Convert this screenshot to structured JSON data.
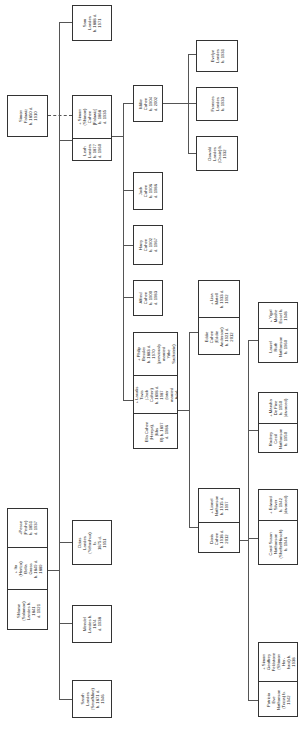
{
  "diagram": {
    "type": "family-tree",
    "orientation": "rotated-90-ccw",
    "root_couple": {
      "spouse": "Simon Falowiz\nb. 1850 d. 1910",
      "person": "Leah Landes\nb. 1877\nd. 1960",
      "husband": "+ Simon\n(Shimon) Cohen\n[Falowiz] b. 1868\nd. 1935"
    },
    "generation1": {
      "sam": "Sam Landes\nb. 1888 d. 1971",
      "ozias": "Ozias Landes\n(Yehoshua) b.\n1875 d. 1951",
      "mendel": "Mendel\nLandes b. 1874\nd. 1938",
      "sarah": "Sarah Landes\n(Sera/Mine)\nb. 1871 d. 1946",
      "parents": {
        "shlome": "Shlome (Solomon)\nLandes b. 1841\nd. 1921",
        "ita": "+ Ita (Hertzo)\nBella Gross\nb. 1849 d. 1889",
        "peshe": "+Pesse\n(Peshe)\nb. 1851\nd. 1937"
      }
    },
    "generation2": {
      "millie": "Millie Cohen\nb. 1904 d. 2002",
      "jack": "Jack Cohen\nb. 1906 d. 1986",
      "harry": "Harry Cohen\nb. 1902 d. 1967",
      "alfred": "Alfred Cohen\nb. 1900 d. 1983",
      "ella": "Ella Cohen\n(Henya), (Mrs\nB) b. 1897\nd. 1986",
      "lavalis": "+ Lavalis Tsvis\n(Jack Cohen)\nb. 1898 d. 1987\n(later married\nAda)",
      "philip": "+ Philip Bessler\nb. 1883 d. 1970\n(previously\nmarried Yitke\nSackstein)"
    },
    "generation3": {
      "evelyn": "Evelyn\nLandes\nb. 1931",
      "frances": "Frances\nLandes\nb. 1933",
      "oswald": "Oswald\nLandes\n(Ossie) b. 1932",
      "eddie": "Eddie Cohen\n(Eddie\nAnderson)\nb. 1921 d. 2012",
      "lisa": "+ Lisa Matell\nb. 1933 d. 1992",
      "doris": "Doris Cohen\nb. 1918 d. 2012",
      "lionel": "+ Lionel\nNathanson\nb. 1915 d. 1997"
    },
    "generation4": {
      "laurel": "Laurel Ruth\nNathanson\nb. 1960",
      "yigal": "+ Yigal Moshe\nEssel b. 1948",
      "rodney": "Rodney Cecil\nNathanson\nb. 1950",
      "marsha": "+ Marsha De Fine\nb. 1950\n(divorced)",
      "carol": "Carol Susan\nNathanson\n(Sheftel/Hirsch)\nb. 1946",
      "edward": "+ Edward Silver\nb. 1942\n(divorced)",
      "patricia": "Patricia Eve\nNathanson\n(Tricia) b. 1942",
      "simon_f": "+ Simon\nGeoffrey\nFeldstone\n(Shimon Her-\nhard) b. 1938"
    }
  }
}
